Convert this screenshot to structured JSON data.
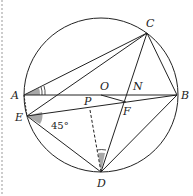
{
  "diagram": {
    "type": "geometry",
    "points": {
      "A": {
        "label": "A",
        "x": 24,
        "y": 95
      },
      "B": {
        "label": "B",
        "x": 177,
        "y": 95
      },
      "C": {
        "label": "C",
        "x": 147,
        "y": 33
      },
      "D": {
        "label": "D",
        "x": 101,
        "y": 172
      },
      "E": {
        "label": "E",
        "x": 27,
        "y": 116
      },
      "O": {
        "label": "O",
        "x": 101,
        "y": 95
      },
      "P": {
        "label": "P",
        "x": 90,
        "y": 101
      },
      "F": {
        "label": "F",
        "x": 126,
        "y": 102
      },
      "N": {
        "label": "N",
        "x": 131,
        "y": 95
      }
    },
    "angle_label": "45°",
    "colors": {
      "stroke": "#222222",
      "shade": "#a8a8a8",
      "border": "#999999"
    }
  }
}
